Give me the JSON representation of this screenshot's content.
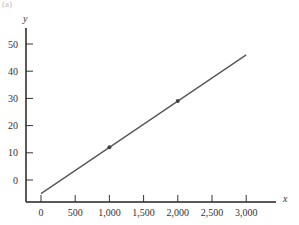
{
  "panel_label": "(a)",
  "chart_data": {
    "type": "line",
    "title": "",
    "xlabel": "x",
    "ylabel": "y",
    "x_ticks": [
      0,
      500,
      1000,
      1500,
      2000,
      2500,
      3000
    ],
    "x_tick_labels": [
      "0",
      "500",
      "1,000",
      "1,500",
      "2,000",
      "2,500",
      "3,000"
    ],
    "y_ticks": [
      0,
      10,
      20,
      30,
      40,
      50
    ],
    "y_tick_labels": [
      "0",
      "10",
      "20",
      "30",
      "40",
      "50"
    ],
    "xlim": [
      -220,
      3450
    ],
    "ylim": [
      -8,
      56
    ],
    "grid": false,
    "series": [
      {
        "name": "line",
        "x": [
          0,
          3000
        ],
        "y": [
          -5,
          46
        ],
        "color": "#555555"
      }
    ],
    "points": [
      {
        "x": 1000,
        "y": 12
      },
      {
        "x": 2000,
        "y": 29
      }
    ]
  }
}
